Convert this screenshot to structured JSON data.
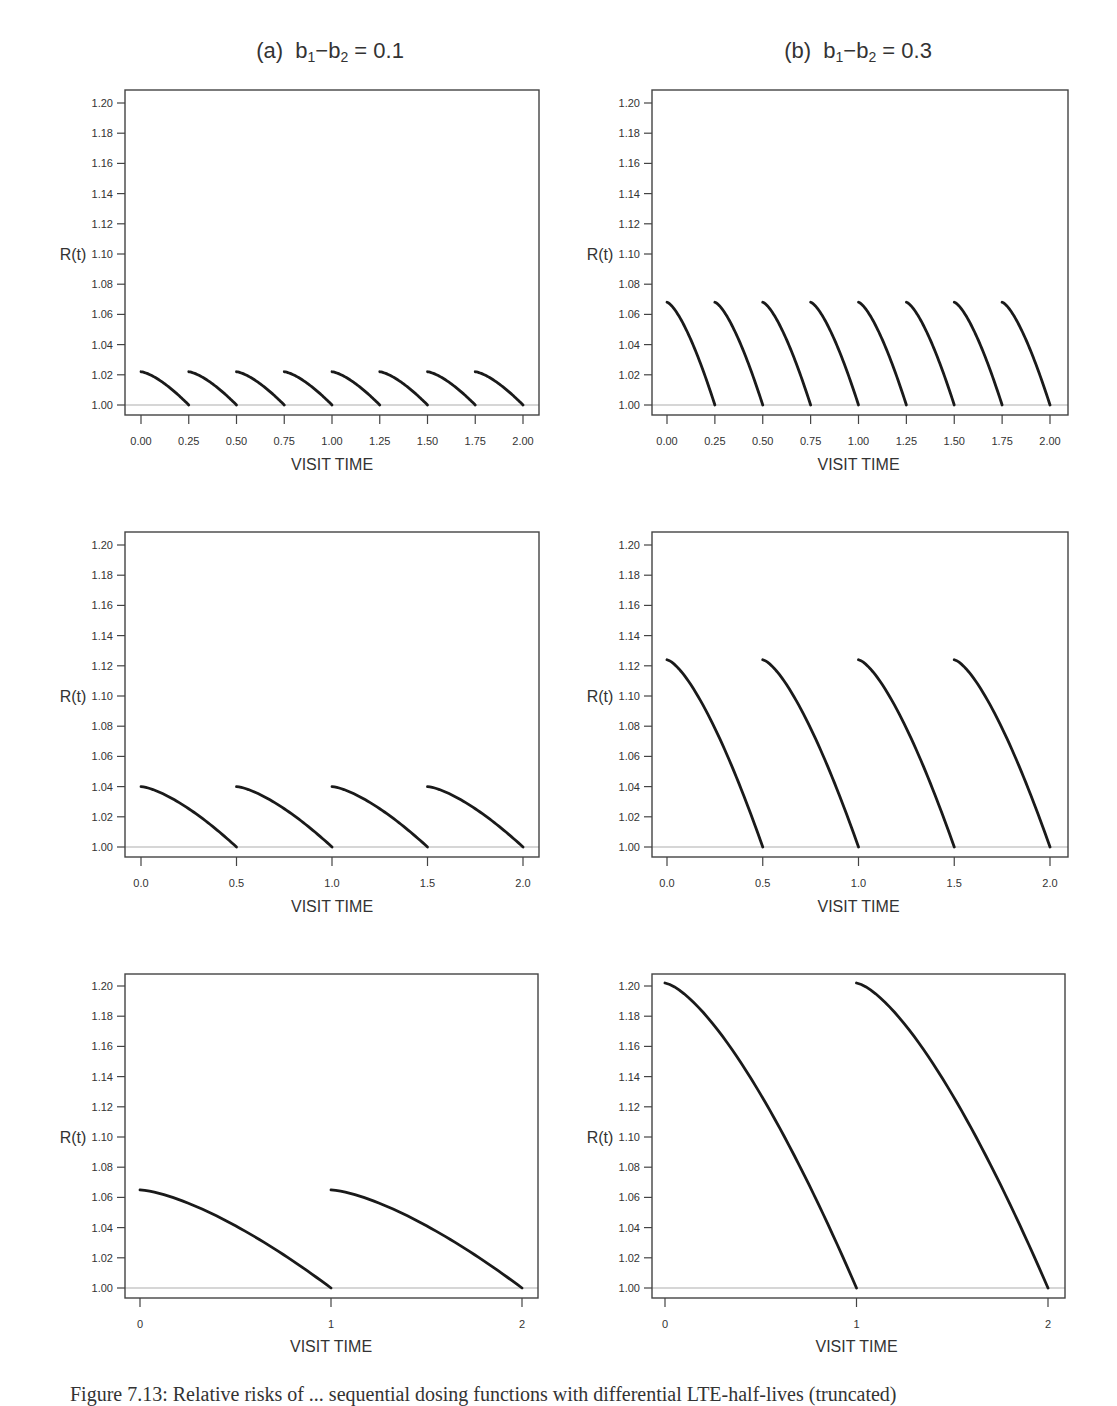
{
  "figure": {
    "caption": "Figure 7.13: Relative risks of ... sequential dosing functions with differential LTE-half-lives (truncated)"
  },
  "columns": [
    {
      "label": "(a)",
      "expr_b1": "b",
      "sub1": "1",
      "minus": "−",
      "expr_b2": "b",
      "sub2": "2",
      "eq": " = 0.1",
      "center_x": 330
    },
    {
      "label": "(b)",
      "expr_b1": "b",
      "sub1": "1",
      "minus": "−",
      "expr_b2": "b",
      "sub2": "2",
      "eq": " = 0.3",
      "center_x": 858
    }
  ],
  "chart_data": [
    {
      "type": "line",
      "panel": "row1-a",
      "title": "(a) b1 - b2 = 0.1",
      "xlabel": "VISIT TIME",
      "ylabel": "R(t)",
      "ylim": [
        1.0,
        1.2
      ],
      "xlim": [
        0,
        2
      ],
      "xticks": [
        0.0,
        0.25,
        0.5,
        0.75,
        1.0,
        1.25,
        1.5,
        1.75,
        2.0
      ],
      "xtick_labels": [
        "0.00",
        "0.25",
        "0.50",
        "0.75",
        "1.00",
        "1.25",
        "1.50",
        "1.75",
        "2.00"
      ],
      "yticks": [
        1.0,
        1.02,
        1.04,
        1.06,
        1.08,
        1.1,
        1.12,
        1.14,
        1.16,
        1.18,
        1.2
      ],
      "ytick_labels": [
        "1.00",
        "1.02",
        "1.04",
        "1.06",
        "1.08",
        "1.10",
        "1.12",
        "1.14",
        "1.16",
        "1.18",
        "1.20"
      ],
      "reference_line": 1.0,
      "interval": 0.25,
      "peak": 1.022,
      "segments": [
        [
          0.0,
          0.25
        ],
        [
          0.25,
          0.5
        ],
        [
          0.5,
          0.75
        ],
        [
          0.75,
          1.0
        ],
        [
          1.0,
          1.25
        ],
        [
          1.25,
          1.5
        ],
        [
          1.5,
          1.75
        ],
        [
          1.75,
          2.0
        ]
      ],
      "series": [
        {
          "name": "R(t)",
          "x_start_values": [
            0,
            0.25,
            0.5,
            0.75,
            1,
            1.25,
            1.5,
            1.75
          ],
          "start_value": 1.022,
          "end_value": 1.0
        }
      ]
    },
    {
      "type": "line",
      "panel": "row1-b",
      "title": "(b) b1 - b2 = 0.3",
      "xlabel": "VISIT TIME",
      "ylabel": "R(t)",
      "ylim": [
        1.0,
        1.2
      ],
      "xlim": [
        0,
        2
      ],
      "xticks": [
        0.0,
        0.25,
        0.5,
        0.75,
        1.0,
        1.25,
        1.5,
        1.75,
        2.0
      ],
      "xtick_labels": [
        "0.00",
        "0.25",
        "0.50",
        "0.75",
        "1.00",
        "1.25",
        "1.50",
        "1.75",
        "2.00"
      ],
      "yticks": [
        1.0,
        1.02,
        1.04,
        1.06,
        1.08,
        1.1,
        1.12,
        1.14,
        1.16,
        1.18,
        1.2
      ],
      "ytick_labels": [
        "1.00",
        "1.02",
        "1.04",
        "1.06",
        "1.08",
        "1.10",
        "1.12",
        "1.14",
        "1.16",
        "1.18",
        "1.20"
      ],
      "reference_line": 1.0,
      "interval": 0.25,
      "peak": 1.068,
      "segments": [
        [
          0.0,
          0.25
        ],
        [
          0.25,
          0.5
        ],
        [
          0.5,
          0.75
        ],
        [
          0.75,
          1.0
        ],
        [
          1.0,
          1.25
        ],
        [
          1.25,
          1.5
        ],
        [
          1.5,
          1.75
        ],
        [
          1.75,
          2.0
        ]
      ],
      "series": [
        {
          "name": "R(t)",
          "x_start_values": [
            0,
            0.25,
            0.5,
            0.75,
            1,
            1.25,
            1.5,
            1.75
          ],
          "start_value": 1.068,
          "end_value": 1.0
        }
      ]
    },
    {
      "type": "line",
      "panel": "row2-a",
      "xlabel": "VISIT TIME",
      "ylabel": "R(t)",
      "ylim": [
        1.0,
        1.2
      ],
      "xlim": [
        0,
        2
      ],
      "xticks": [
        0.0,
        0.5,
        1.0,
        1.5,
        2.0
      ],
      "xtick_labels": [
        "0.0",
        "0.5",
        "1.0",
        "1.5",
        "2.0"
      ],
      "yticks": [
        1.0,
        1.02,
        1.04,
        1.06,
        1.08,
        1.1,
        1.12,
        1.14,
        1.16,
        1.18,
        1.2
      ],
      "ytick_labels": [
        "1.00",
        "1.02",
        "1.04",
        "1.06",
        "1.08",
        "1.10",
        "1.12",
        "1.14",
        "1.16",
        "1.18",
        "1.20"
      ],
      "reference_line": 1.0,
      "interval": 0.5,
      "peak": 1.04,
      "segments": [
        [
          0.0,
          0.5
        ],
        [
          0.5,
          1.0
        ],
        [
          1.0,
          1.5
        ],
        [
          1.5,
          2.0
        ]
      ],
      "series": [
        {
          "name": "R(t)",
          "x_start_values": [
            0,
            0.5,
            1.0,
            1.5
          ],
          "start_value": 1.04,
          "end_value": 1.0
        }
      ]
    },
    {
      "type": "line",
      "panel": "row2-b",
      "xlabel": "VISIT TIME",
      "ylabel": "R(t)",
      "ylim": [
        1.0,
        1.2
      ],
      "xlim": [
        0,
        2
      ],
      "xticks": [
        0.0,
        0.5,
        1.0,
        1.5,
        2.0
      ],
      "xtick_labels": [
        "0.0",
        "0.5",
        "1.0",
        "1.5",
        "2.0"
      ],
      "yticks": [
        1.0,
        1.02,
        1.04,
        1.06,
        1.08,
        1.1,
        1.12,
        1.14,
        1.16,
        1.18,
        1.2
      ],
      "ytick_labels": [
        "1.00",
        "1.02",
        "1.04",
        "1.06",
        "1.08",
        "1.10",
        "1.12",
        "1.14",
        "1.16",
        "1.18",
        "1.20"
      ],
      "reference_line": 1.0,
      "interval": 0.5,
      "peak": 1.124,
      "segments": [
        [
          0.0,
          0.5
        ],
        [
          0.5,
          1.0
        ],
        [
          1.0,
          1.5
        ],
        [
          1.5,
          2.0
        ]
      ],
      "series": [
        {
          "name": "R(t)",
          "x_start_values": [
            0,
            0.5,
            1.0,
            1.5
          ],
          "start_value": 1.124,
          "end_value": 1.0
        }
      ]
    },
    {
      "type": "line",
      "panel": "row3-a",
      "xlabel": "VISIT TIME",
      "ylabel": "R(t)",
      "ylim": [
        1.0,
        1.2
      ],
      "xlim": [
        0,
        2
      ],
      "xticks": [
        0,
        1,
        2
      ],
      "xtick_labels": [
        "0",
        "1",
        "2"
      ],
      "yticks": [
        1.0,
        1.02,
        1.04,
        1.06,
        1.08,
        1.1,
        1.12,
        1.14,
        1.16,
        1.18,
        1.2
      ],
      "ytick_labels": [
        "1.00",
        "1.02",
        "1.04",
        "1.06",
        "1.08",
        "1.10",
        "1.12",
        "1.14",
        "1.16",
        "1.18",
        "1.20"
      ],
      "reference_line": 1.0,
      "interval": 1,
      "peak": 1.065,
      "segments": [
        [
          0,
          1
        ],
        [
          1,
          2
        ]
      ],
      "series": [
        {
          "name": "R(t)",
          "x_start_values": [
            0,
            1
          ],
          "start_value": 1.065,
          "end_value": 1.0
        }
      ]
    },
    {
      "type": "line",
      "panel": "row3-b",
      "xlabel": "VISIT TIME",
      "ylabel": "R(t)",
      "ylim": [
        1.0,
        1.2
      ],
      "xlim": [
        0,
        2
      ],
      "xticks": [
        0,
        1,
        2
      ],
      "xtick_labels": [
        "0",
        "1",
        "2"
      ],
      "yticks": [
        1.0,
        1.02,
        1.04,
        1.06,
        1.08,
        1.1,
        1.12,
        1.14,
        1.16,
        1.18,
        1.2
      ],
      "ytick_labels": [
        "1.00",
        "1.02",
        "1.04",
        "1.06",
        "1.08",
        "1.10",
        "1.12",
        "1.14",
        "1.16",
        "1.18",
        "1.20"
      ],
      "reference_line": 1.0,
      "interval": 1,
      "peak": 1.202,
      "segments": [
        [
          0,
          1
        ],
        [
          1,
          2
        ]
      ],
      "series": [
        {
          "name": "R(t)",
          "x_start_values": [
            0,
            1
          ],
          "start_value": 1.202,
          "end_value": 1.0
        }
      ]
    }
  ],
  "layout": {
    "panels": [
      {
        "id": "row1-a",
        "box": [
          125,
          90,
          539,
          415
        ],
        "y_top": 103,
        "y_bottom": 405,
        "x0": 141,
        "x2": 523,
        "label_x": 73,
        "xlabel_y": 470
      },
      {
        "id": "row1-b",
        "box": [
          652,
          90,
          1068,
          415
        ],
        "y_top": 103,
        "y_bottom": 405,
        "x0": 667,
        "x2": 1050,
        "label_x": 600,
        "xlabel_y": 470
      },
      {
        "id": "row2-a",
        "box": [
          125,
          532,
          539,
          857
        ],
        "y_top": 545,
        "y_bottom": 847,
        "x0": 141,
        "x2": 523,
        "label_x": 73,
        "xlabel_y": 912
      },
      {
        "id": "row2-b",
        "box": [
          652,
          532,
          1068,
          857
        ],
        "y_top": 545,
        "y_bottom": 847,
        "x0": 667,
        "x2": 1050,
        "label_x": 600,
        "xlabel_y": 912
      },
      {
        "id": "row3-a",
        "box": [
          125,
          974,
          538,
          1298
        ],
        "y_top": 986,
        "y_bottom": 1288,
        "x0": 140,
        "x2": 522,
        "label_x": 73,
        "xlabel_y": 1352
      },
      {
        "id": "row3-b",
        "box": [
          652,
          974,
          1065,
          1298
        ],
        "y_top": 986,
        "y_bottom": 1288,
        "x0": 665,
        "x2": 1048,
        "label_x": 600,
        "xlabel_y": 1352
      }
    ],
    "colors": {
      "curve": "#1a1a1a",
      "axis": "#444444",
      "reference": "#c8c8c8",
      "text": "#333333"
    }
  }
}
